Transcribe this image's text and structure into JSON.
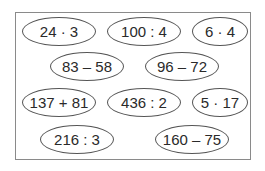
{
  "exercises": [
    {
      "expr": "24 · 3",
      "x": 22,
      "y": 17,
      "w": 74,
      "h": 29
    },
    {
      "expr": "100 : 4",
      "x": 107,
      "y": 17,
      "w": 74,
      "h": 29
    },
    {
      "expr": "6 · 4",
      "x": 192,
      "y": 17,
      "w": 56,
      "h": 29
    },
    {
      "expr": "83 – 58",
      "x": 50,
      "y": 52,
      "w": 74,
      "h": 29
    },
    {
      "expr": "96 – 72",
      "x": 145,
      "y": 52,
      "w": 74,
      "h": 29
    },
    {
      "expr": "137 + 81",
      "x": 22,
      "y": 88,
      "w": 74,
      "h": 29
    },
    {
      "expr": "436 : 2",
      "x": 107,
      "y": 88,
      "w": 74,
      "h": 29
    },
    {
      "expr": "5 · 17",
      "x": 192,
      "y": 88,
      "w": 56,
      "h": 29
    },
    {
      "expr": "216 : 3",
      "x": 40,
      "y": 125,
      "w": 74,
      "h": 29
    },
    {
      "expr": "160 – 75",
      "x": 155,
      "y": 125,
      "w": 74,
      "h": 29
    }
  ]
}
